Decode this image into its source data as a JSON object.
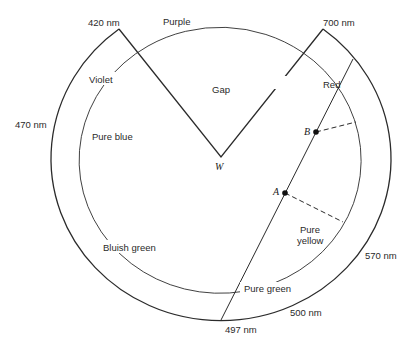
{
  "diagram": {
    "type": "chromaticity-color-circle",
    "colors": {
      "line": "#2b2b2b",
      "text": "#2a2a2a",
      "background": "#ffffff"
    },
    "wavelength_labels": {
      "nm420": "420 nm",
      "nm700": "700 nm",
      "nm470": "470 nm",
      "nm570": "570 nm",
      "nm500": "500 nm",
      "nm497": "497 nm"
    },
    "hue_labels": {
      "purple": "Purple",
      "violet": "Violet",
      "pure_blue": "Pure blue",
      "gap": "Gap",
      "red": "Red",
      "bluish_green": "Bluish green",
      "pure_yellow_line1": "Pure",
      "pure_yellow_line2": "yellow",
      "pure_green": "Pure green"
    },
    "points": {
      "white": "W",
      "a": "A",
      "b": "B"
    }
  }
}
